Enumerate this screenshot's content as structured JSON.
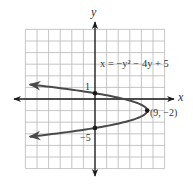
{
  "chart_data": {
    "type": "line",
    "title": "",
    "equation": "x = −y² − 4y + 5",
    "xlabel": "x",
    "ylabel": "y",
    "xlim": [
      -12,
      12
    ],
    "ylim": [
      -12,
      12
    ],
    "grid": true,
    "grid_step": 2,
    "curve": {
      "form": "x = -y^2 - 4y + 5",
      "a": -1,
      "b": -4,
      "c": 5,
      "y_range": [
        -6.5,
        2.5
      ],
      "arrows_both_ends": true
    },
    "points": [
      {
        "x": 0,
        "y": 1,
        "label": "1",
        "label_role": "y-intercept"
      },
      {
        "x": 0,
        "y": -5,
        "label": "−5",
        "label_role": "y-intercept"
      },
      {
        "x": 9,
        "y": -2,
        "label": "(9, −2)",
        "label_role": "vertex"
      }
    ],
    "legend": null
  },
  "colors": {
    "grid": "#b8b8b8",
    "axis": "#1a1a1a",
    "curve": "#4a4a4a",
    "text": "#333333",
    "background": "#ffffff"
  },
  "layout": {
    "origin_px": [
      95,
      99
    ],
    "px_per_unit": 5.8
  }
}
